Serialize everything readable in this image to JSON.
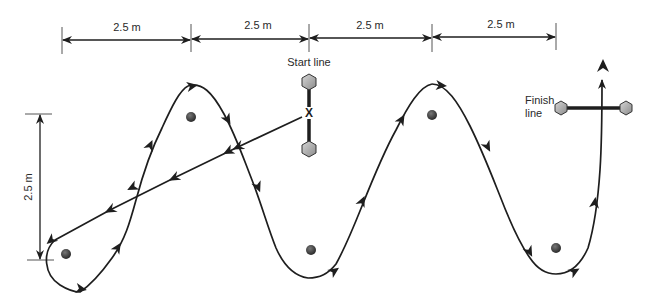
{
  "diagram": {
    "type": "slalom-course",
    "horizontal_dimensions": [
      {
        "label": "2.5 m",
        "x1": 62,
        "x2": 191
      },
      {
        "label": "2.5 m",
        "x1": 191,
        "x2": 309
      },
      {
        "label": "2.5 m",
        "x1": 309,
        "x2": 432
      },
      {
        "label": "2.5 m",
        "x1": 432,
        "x2": 556
      }
    ],
    "vertical_dimension": {
      "label": "2.5 m"
    },
    "start_line": {
      "label": "Start line",
      "marker": "X"
    },
    "finish_line": {
      "label_line1": "Finish",
      "label_line2": "line"
    },
    "cones": [
      {
        "x": 66,
        "y": 254
      },
      {
        "x": 191,
        "y": 117
      },
      {
        "x": 311,
        "y": 250
      },
      {
        "x": 432,
        "y": 115
      },
      {
        "x": 556,
        "y": 248
      }
    ],
    "colors": {
      "line": "#1e1e1e",
      "cone": "#444444",
      "hexagon_fill": "#b5b5b5",
      "text": "#2a2a2a"
    }
  }
}
